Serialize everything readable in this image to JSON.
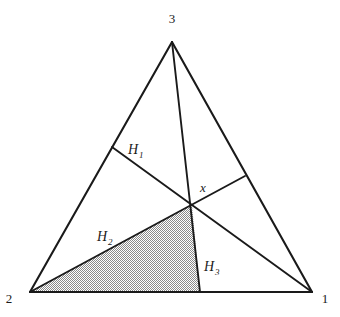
{
  "figure": {
    "title": "",
    "background_color": "#ffffff",
    "stroke_color": "#1a1a1a",
    "shade_color": "#a8a8a8",
    "triangle": {
      "vertices": [
        {
          "name": "vertex-1",
          "label": "1",
          "x": 312,
          "y": 292,
          "label_x": 325,
          "label_y": 303
        },
        {
          "name": "vertex-2",
          "label": "2",
          "x": 30,
          "y": 292,
          "label_x": 9,
          "label_y": 303
        },
        {
          "name": "vertex-3",
          "label": "3",
          "x": 172,
          "y": 42,
          "label_x": 172,
          "label_y": 23
        }
      ]
    },
    "interior_point": {
      "name": "point-x",
      "label": "x",
      "x": 192,
      "y": 205,
      "label_x": 203,
      "label_y": 192
    },
    "cevian_feet": [
      {
        "name": "foot-on-left-edge",
        "x": 112,
        "y": 147
      },
      {
        "name": "foot-on-right-edge",
        "x": 245,
        "y": 176
      },
      {
        "name": "foot-on-base",
        "x": 200,
        "y": 292
      }
    ],
    "regions": [
      {
        "name": "region-h1",
        "label": "H",
        "sub": "1",
        "label_x": 128,
        "label_y": 154,
        "shaded": false
      },
      {
        "name": "region-h2",
        "label": "H",
        "sub": "2",
        "label_x": 97,
        "label_y": 241,
        "shaded": false
      },
      {
        "name": "region-h3",
        "label": "H",
        "sub": "3",
        "label_x": 204,
        "label_y": 271,
        "shaded": false
      }
    ],
    "shaded_region": {
      "name": "shaded-sub-triangle",
      "points": "30,292 192,205 200,292"
    }
  }
}
